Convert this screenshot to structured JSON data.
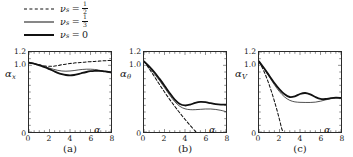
{
  "figure": {
    "type": "multi-panel-line-plot",
    "panel_count": 3
  },
  "legend": {
    "position": "top-left",
    "items": [
      {
        "style": "dashed",
        "symbol": "ν",
        "subscript": "s",
        "equals": "=",
        "value": "1/2",
        "numerator": "1",
        "denominator": "2",
        "label": "ν_s = 1/2"
      },
      {
        "style": "thin-solid",
        "symbol": "ν",
        "subscript": "s",
        "equals": "=",
        "value": "1/3",
        "numerator": "1",
        "denominator": "3",
        "label": "ν_s = 1/3"
      },
      {
        "style": "thick-solid",
        "symbol": "ν",
        "subscript": "s",
        "equals": "=",
        "value": "0",
        "label": "ν_s = 0"
      }
    ]
  },
  "chart_data": [
    {
      "type": "line",
      "panel": "a",
      "caption": "(a)",
      "title": "",
      "xlabel": "α",
      "ylabel": "α_x",
      "ylabel_base": "α",
      "ylabel_sub": "x",
      "xlim": [
        0,
        8
      ],
      "ylim": [
        0,
        1.2
      ],
      "xticks": [
        0,
        2,
        4,
        6,
        8
      ],
      "yticks": [
        0,
        1.0,
        1.2
      ],
      "ytick_labels": [
        "0",
        "1.0",
        "1.2"
      ],
      "grid": false,
      "series": [
        {
          "name": "ν_s = 1/2",
          "style": "dashed",
          "x": [
            0,
            0.4,
            0.8,
            1.2,
            1.6,
            2.0,
            2.4,
            2.8,
            3.2,
            3.6,
            4.0,
            4.4,
            4.8,
            5.2,
            5.6,
            6.0,
            6.4,
            6.8,
            7.2,
            7.6,
            8.0
          ],
          "y": [
            1.035,
            1.025,
            1.012,
            1.0,
            0.99,
            0.985,
            0.988,
            0.997,
            1.008,
            1.018,
            1.027,
            1.034,
            1.04,
            1.045,
            1.05,
            1.055,
            1.059,
            1.063,
            1.067,
            1.07,
            1.073
          ]
        },
        {
          "name": "ν_s = 1/3",
          "style": "thin-solid",
          "x": [
            0,
            0.4,
            0.8,
            1.2,
            1.6,
            2.0,
            2.4,
            2.8,
            3.2,
            3.6,
            4.0,
            4.4,
            4.8,
            5.2,
            5.6,
            6.0,
            6.4,
            6.8,
            7.2,
            7.6,
            8.0
          ],
          "y": [
            1.04,
            1.03,
            1.015,
            0.997,
            0.978,
            0.958,
            0.94,
            0.925,
            0.915,
            0.912,
            0.915,
            0.922,
            0.931,
            0.938,
            0.942,
            0.942,
            0.938,
            0.928,
            0.915,
            0.9,
            0.885
          ]
        },
        {
          "name": "ν_s = 0",
          "style": "thick-solid",
          "x": [
            0,
            0.4,
            0.8,
            1.2,
            1.6,
            2.0,
            2.4,
            2.8,
            3.2,
            3.6,
            4.0,
            4.4,
            4.8,
            5.2,
            5.6,
            6.0,
            6.4,
            6.8,
            7.2,
            7.6,
            8.0
          ],
          "y": [
            1.04,
            1.03,
            1.012,
            0.992,
            0.968,
            0.942,
            0.915,
            0.888,
            0.868,
            0.855,
            0.85,
            0.855,
            0.868,
            0.885,
            0.9,
            0.912,
            0.918,
            0.918,
            0.913,
            0.905,
            0.897
          ]
        }
      ]
    },
    {
      "type": "line",
      "panel": "b",
      "caption": "(b)",
      "title": "",
      "xlabel": "α",
      "ylabel": "α_θ",
      "ylabel_base": "α",
      "ylabel_sub": "θ",
      "xlim": [
        0,
        8
      ],
      "ylim": [
        0,
        1.2
      ],
      "xticks": [
        0,
        2,
        4,
        6,
        8
      ],
      "yticks": [
        0,
        1.0,
        1.2
      ],
      "ytick_labels": [
        "0",
        "1.0",
        "1.2"
      ],
      "grid": false,
      "series": [
        {
          "name": "ν_s = 1/2",
          "style": "dashed",
          "x": [
            0,
            0.5,
            1.0,
            1.5,
            2.0,
            2.5,
            3.0,
            3.5,
            4.0,
            4.5,
            5.0,
            5.1
          ],
          "y": [
            1.06,
            0.95,
            0.835,
            0.715,
            0.6,
            0.49,
            0.385,
            0.285,
            0.19,
            0.1,
            0.012,
            0.0
          ]
        },
        {
          "name": "ν_s = 1/3",
          "style": "thin-solid",
          "x": [
            0,
            0.5,
            1.0,
            1.5,
            2.0,
            2.5,
            3.0,
            3.5,
            4.0,
            4.5,
            5.0,
            5.5,
            6.0,
            6.5,
            7.0,
            7.5,
            8.0
          ],
          "y": [
            1.06,
            0.97,
            0.875,
            0.775,
            0.665,
            0.555,
            0.455,
            0.385,
            0.348,
            0.335,
            0.335,
            0.34,
            0.345,
            0.345,
            0.338,
            0.325,
            0.305
          ]
        },
        {
          "name": "ν_s = 0",
          "style": "thick-solid",
          "x": [
            0,
            0.5,
            1.0,
            1.5,
            2.0,
            2.5,
            3.0,
            3.5,
            4.0,
            4.5,
            5.0,
            5.5,
            6.0,
            6.5,
            7.0,
            7.5,
            8.0
          ],
          "y": [
            1.06,
            0.985,
            0.9,
            0.8,
            0.695,
            0.585,
            0.485,
            0.42,
            0.398,
            0.41,
            0.437,
            0.452,
            0.448,
            0.432,
            0.418,
            0.412,
            0.412
          ]
        }
      ]
    },
    {
      "type": "line",
      "panel": "c",
      "caption": "(c)",
      "title": "",
      "xlabel": "α",
      "ylabel": "α_V",
      "ylabel_base": "α",
      "ylabel_sub": "V",
      "xlim": [
        0,
        8
      ],
      "ylim": [
        0,
        1.2
      ],
      "xticks": [
        0,
        2,
        4,
        6,
        8
      ],
      "yticks": [
        0,
        1.0,
        1.2
      ],
      "ytick_labels": [
        "0",
        "1.0",
        "1.2"
      ],
      "grid": false,
      "series": [
        {
          "name": "ν_s = 1/2",
          "style": "dashed",
          "x": [
            0,
            0.25,
            0.5,
            0.75,
            1.0,
            1.25,
            1.5,
            1.75,
            2.0,
            2.2,
            2.35
          ],
          "y": [
            1.05,
            0.985,
            0.905,
            0.81,
            0.705,
            0.59,
            0.465,
            0.33,
            0.185,
            0.06,
            0.0
          ]
        },
        {
          "name": "ν_s = 1/3",
          "style": "thin-solid",
          "x": [
            0,
            0.5,
            1.0,
            1.5,
            2.0,
            2.5,
            3.0,
            3.5,
            4.0,
            4.5,
            5.0,
            5.5,
            6.0,
            6.5,
            7.0,
            7.5,
            8.0
          ],
          "y": [
            1.06,
            0.95,
            0.83,
            0.71,
            0.605,
            0.525,
            0.475,
            0.452,
            0.445,
            0.443,
            0.443,
            0.448,
            0.462,
            0.482,
            0.5,
            0.508,
            0.505
          ]
        },
        {
          "name": "ν_s = 0",
          "style": "thick-solid",
          "x": [
            0,
            0.5,
            1.0,
            1.5,
            2.0,
            2.5,
            3.0,
            3.5,
            4.0,
            4.5,
            5.0,
            5.5,
            6.0,
            6.5,
            7.0,
            7.5,
            8.0
          ],
          "y": [
            1.06,
            0.955,
            0.845,
            0.735,
            0.64,
            0.565,
            0.525,
            0.535,
            0.57,
            0.585,
            0.565,
            0.525,
            0.497,
            0.495,
            0.508,
            0.515,
            0.512
          ]
        }
      ]
    }
  ]
}
